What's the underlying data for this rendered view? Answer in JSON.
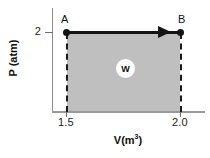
{
  "chart_data": {
    "type": "line",
    "title": "",
    "subtitle": "",
    "xlabel_text": "V(m",
    "xlabel_exponent": "3",
    "xlabel_tail": ")",
    "ylabel": "P (atm)",
    "xticks": [
      "1.5",
      "2.0"
    ],
    "yticks": [
      "2"
    ],
    "xlim": [
      1.5,
      2.0
    ],
    "ylim": [
      0,
      2
    ],
    "grid": false,
    "legend": "none",
    "series": [
      {
        "name": "isobaric-expansion",
        "points": [
          {
            "label": "A",
            "x": 1.5,
            "y": 2
          },
          {
            "label": "B",
            "x": 2.0,
            "y": 2
          }
        ],
        "direction": "A-to-B",
        "line_color": "#141414"
      }
    ],
    "shaded_region": {
      "label": "W",
      "description": "work done area under A-B",
      "fill_color": "#bfbfbf",
      "x_range": [
        1.5,
        2.0
      ],
      "y_range": [
        0,
        2
      ]
    },
    "annotations": [
      {
        "name": "point-label-a",
        "text": "A"
      },
      {
        "name": "point-label-b",
        "text": "B"
      },
      {
        "name": "work-badge",
        "text": "W"
      }
    ],
    "colors": {
      "axis": "#8c8c8c",
      "line": "#141414",
      "fill": "#bfbfbf",
      "text": "#101010"
    }
  },
  "figure": {
    "axis_title_y": "P (atm)",
    "axis_title_x_base": "V(m",
    "axis_title_x_sup": "3",
    "axis_title_x_close": ")",
    "tick_y_2": "2",
    "tick_x_15": "1.5",
    "tick_x_20": "2.0",
    "point_a": "A",
    "point_b": "B",
    "work_label": "W"
  }
}
